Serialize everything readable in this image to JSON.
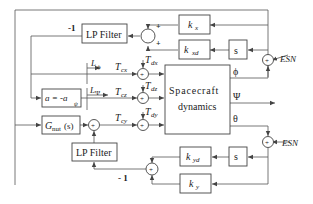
{
  "diagram": {
    "blocks": {
      "lp_filter_top": "LP Filter",
      "lp_filter_bottom": "LP Filter",
      "kx": "k",
      "kx_sub": "x",
      "kxd": "k",
      "kxd_sub": "xd",
      "s_top": "s",
      "s_bottom": "s",
      "kyd": "k",
      "kyd_sub": "yd",
      "ky": "k",
      "ky_sub": "y",
      "a_block": "a = -a",
      "a_block_sub": "ψ",
      "gnut": "G",
      "gnut_sub": "nut",
      "gnut_arg": "(s)",
      "spacecraft_line1": "Spacecraft",
      "spacecraft_line2": "dynamics"
    },
    "signals": {
      "neg_one_top": "-1",
      "neg_one_bottom": "- 1",
      "esn_top": "ESN",
      "esn_bottom": "ESN",
      "phi": "ϕ",
      "psi": "Ψ",
      "theta": "θ",
      "L_phi": "L",
      "L_phi_sub": "ϕ",
      "L_psi": "L",
      "L_psi_sub": "Ψ",
      "Tcx": "T",
      "Tcx_sub": "cx",
      "Tcz": "T",
      "Tcz_sub": "cz",
      "Tcy": "T",
      "Tcy_sub": "cy",
      "Tdx": "T",
      "Tdx_sub": "dx",
      "Tdz": "T",
      "Tdz_sub": "dz",
      "Tdy": "T",
      "Tdy_sub": "dy",
      "plus": "+"
    }
  }
}
